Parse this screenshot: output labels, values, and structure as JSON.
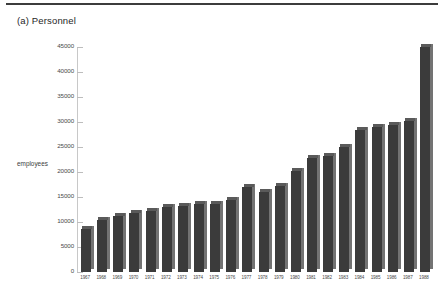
{
  "page": {
    "title": "(a) Personnel",
    "top_rule": true
  },
  "chart_data": {
    "type": "bar",
    "title": "(a) Personnel",
    "xlabel": "",
    "ylabel": "employees",
    "ylim": [
      0,
      45000
    ],
    "ytick_step": 5000,
    "yticks": [
      "45000",
      "40000",
      "35000",
      "30000",
      "25000",
      "20000",
      "15000",
      "10000",
      "5000",
      "0"
    ],
    "grid": false,
    "legend": null,
    "categories": [
      "1967",
      "1968",
      "1969",
      "1970",
      "1971",
      "1972",
      "1973",
      "1974",
      "1975",
      "1976",
      "1977",
      "1978",
      "1979",
      "1980",
      "1981",
      "1982",
      "1983",
      "1984",
      "1985",
      "1986",
      "1987",
      "1988"
    ],
    "values": [
      8700,
      10500,
      11300,
      11800,
      12200,
      13000,
      13300,
      13600,
      13700,
      14400,
      17000,
      16000,
      17200,
      20200,
      22900,
      23300,
      25100,
      28500,
      29000,
      29500,
      30200,
      45000
    ],
    "bar_colors": {
      "front": "#3b3b3b",
      "side": "#737373",
      "top": "#5a5a5a"
    },
    "axis_color": "#c8c8c8"
  }
}
